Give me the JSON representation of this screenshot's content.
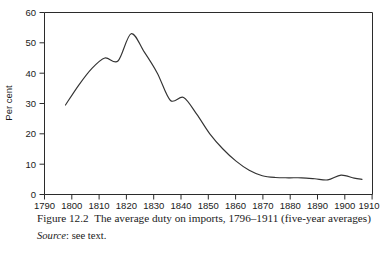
{
  "figure": {
    "caption_label": "Figure 12.2",
    "caption_text": "The average duty on imports, 1796–1911 (five-year averages)",
    "source_label": "Source",
    "source_separator": ":",
    "source_text": "see text."
  },
  "chart_data": {
    "type": "line",
    "title": "The average duty on imports, 1796–1911 (five-year averages)",
    "xlabel": "",
    "ylabel": "Per cent",
    "xlim": [
      1790,
      1915
    ],
    "ylim": [
      0,
      60
    ],
    "xticks": [
      1790,
      1800,
      1810,
      1820,
      1830,
      1840,
      1850,
      1860,
      1870,
      1880,
      1890,
      1900,
      1910
    ],
    "xtick_labels": [
      "1790",
      "1800",
      "1810",
      "1820",
      "1830",
      "1840",
      "1850",
      "1860",
      "1870",
      "1880",
      "1890",
      "1900",
      "1910"
    ],
    "yticks": [
      0,
      10,
      20,
      30,
      40,
      50,
      60
    ],
    "ytick_labels": [
      "0",
      "10",
      "20",
      "30",
      "40",
      "50",
      "60"
    ],
    "grid": false,
    "legend": false,
    "line_color": "#333333",
    "series": [
      {
        "name": "Average duty on imports",
        "x": [
          1798,
          1803,
          1808,
          1813,
          1818,
          1823,
          1828,
          1833,
          1838,
          1843,
          1848,
          1853,
          1858,
          1863,
          1868,
          1873,
          1878,
          1883,
          1888,
          1893,
          1898,
          1903,
          1908,
          1911
        ],
        "values": [
          29.5,
          36.0,
          41.5,
          45.0,
          44.0,
          53.0,
          47.0,
          40.0,
          31.0,
          32.0,
          26.5,
          20.0,
          15.0,
          11.0,
          8.0,
          6.2,
          5.6,
          5.5,
          5.5,
          5.2,
          4.8,
          6.4,
          5.4,
          5.0
        ]
      }
    ]
  }
}
